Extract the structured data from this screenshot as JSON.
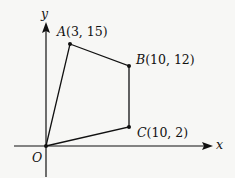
{
  "diagram": {
    "type": "coordinate-geometry",
    "axes": {
      "x_label": "x",
      "y_label": "y",
      "origin_label": "O"
    },
    "points": [
      {
        "name": "A",
        "coords": "(3, 15)",
        "x": 3,
        "y": 15
      },
      {
        "name": "B",
        "coords": "(10, 12)",
        "x": 10,
        "y": 12
      },
      {
        "name": "C",
        "coords": "(10, 2)",
        "x": 10,
        "y": 2
      }
    ],
    "polygon": [
      "O",
      "A",
      "B",
      "C"
    ],
    "colors": {
      "line": "#111111",
      "background": "#f7f7f5"
    }
  }
}
